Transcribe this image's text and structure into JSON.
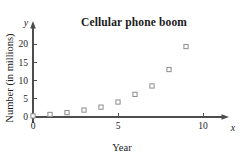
{
  "chart_data": {
    "type": "scatter",
    "title": "Cellular phone boom",
    "xlabel": "Year",
    "ylabel": "Number (in millions)",
    "x_axis_symbol": "x",
    "y_axis_symbol": "y",
    "xlim": [
      0,
      11.5
    ],
    "ylim": [
      0,
      22
    ],
    "xticks": [
      0,
      5,
      10
    ],
    "xtick_labels": [
      "0",
      "5",
      "10"
    ],
    "yticks": [
      0,
      5,
      10,
      15,
      20
    ],
    "ytick_labels": [
      "0",
      "5",
      "10",
      "15",
      "20"
    ],
    "grid": false,
    "legend": "none",
    "marker_style": "open-square",
    "marker_color": "#8c8c8c",
    "axis_color": "#4d4d4d",
    "x": [
      0,
      1,
      2,
      3,
      4,
      5,
      6,
      7,
      8,
      9
    ],
    "values": [
      0.3,
      0.7,
      1.2,
      1.9,
      2.7,
      4.1,
      6.2,
      8.5,
      13.0,
      19.3
    ],
    "points": [
      {
        "x": 0,
        "y": 0.3
      },
      {
        "x": 1,
        "y": 0.7
      },
      {
        "x": 2,
        "y": 1.2
      },
      {
        "x": 3,
        "y": 1.9
      },
      {
        "x": 4,
        "y": 2.7
      },
      {
        "x": 5,
        "y": 4.1
      },
      {
        "x": 6,
        "y": 6.2
      },
      {
        "x": 7,
        "y": 8.5
      },
      {
        "x": 8,
        "y": 13.0
      },
      {
        "x": 9,
        "y": 19.3
      }
    ]
  }
}
